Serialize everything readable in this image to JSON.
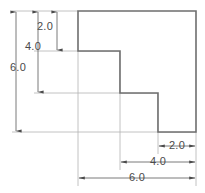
{
  "drawing": {
    "title": "Dimensioned step block",
    "units_note": "",
    "colors": {
      "outline": "#6e6e6e",
      "extension_line": "#b3b3b3",
      "dimension_line": "#6b6b6b",
      "text": "#4a4a4a",
      "background": "#ffffff"
    },
    "part": {
      "name": "step-block-profile",
      "points": "78,11 196,11 196,132 158,132 158,93 120,93 120,51 78,51"
    },
    "vertical_dimensions": [
      {
        "id": "v-2",
        "label": "2.0",
        "value": 2.0,
        "text_x": 45,
        "text_y": 30
      },
      {
        "id": "v-4",
        "label": "4.0",
        "value": 4.0,
        "text_x": 33,
        "text_y": 50
      },
      {
        "id": "v-6",
        "label": "6.0",
        "value": 6.0,
        "text_x": 18,
        "text_y": 71
      }
    ],
    "horizontal_dimensions": [
      {
        "id": "h-2",
        "label": "2.0",
        "value": 2.0,
        "text_x": 177,
        "text_y": 149
      },
      {
        "id": "h-4",
        "label": "4.0",
        "value": 4.0,
        "text_x": 158,
        "text_y": 165
      },
      {
        "id": "h-6",
        "label": "6.0",
        "value": 6.0,
        "text_x": 137,
        "text_y": 181
      }
    ]
  }
}
